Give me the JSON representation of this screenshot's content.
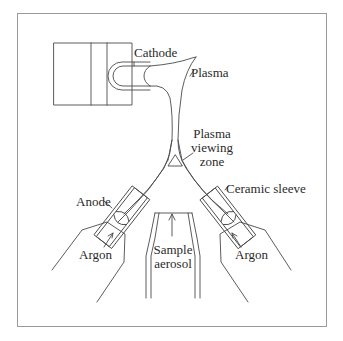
{
  "diagram": {
    "type": "schematic",
    "labels": {
      "cathode": "Cathode",
      "plasma": "Plasma",
      "viewing_zone_line1": "Plasma",
      "viewing_zone_line2": "viewing",
      "viewing_zone_line3": "zone",
      "anode": "Anode",
      "ceramic_sleeve": "Ceramic sleeve",
      "argon_left": "Argon",
      "argon_right": "Argon",
      "sample_line1": "Sample",
      "sample_line2": "aerosol"
    },
    "colors": {
      "line": "#4a4a4a",
      "frame": "#9a9a9a",
      "text": "#2a2a2a",
      "background": "#ffffff"
    }
  }
}
